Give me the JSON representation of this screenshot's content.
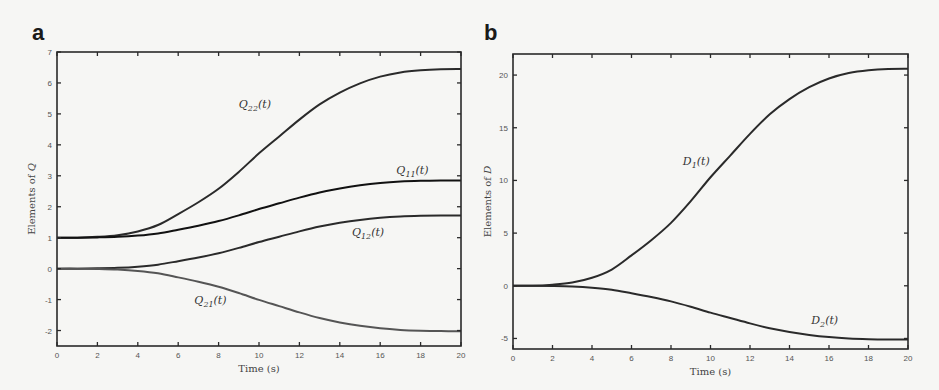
{
  "chart_data": [
    {
      "panel": "a",
      "type": "line",
      "xlabel": "Time (s)",
      "ylabel": "Elements of Q",
      "xlim": [
        0,
        20
      ],
      "ylim": [
        -2.5,
        7
      ],
      "xticks": [
        0,
        2,
        4,
        6,
        8,
        10,
        12,
        14,
        16,
        18,
        20
      ],
      "yticks": [
        -2,
        -1,
        0,
        1,
        2,
        3,
        4,
        5,
        6,
        7
      ],
      "grid": false,
      "legend": "inline curve labels",
      "x": [
        0,
        1,
        2,
        3,
        4,
        5,
        6,
        7,
        8,
        9,
        10,
        11,
        12,
        13,
        14,
        15,
        16,
        17,
        18,
        19,
        20
      ],
      "series": [
        {
          "name": "Q22(t)",
          "label_main": "Q",
          "label_sub": "22",
          "start": 1.0,
          "end": 6.45,
          "label_pos": [
            9.0,
            5.2
          ],
          "color": "#2a2a2a"
        },
        {
          "name": "Q11(t)",
          "label_main": "Q",
          "label_sub": "11",
          "start": 1.0,
          "end": 2.85,
          "label_pos": [
            16.8,
            3.05
          ],
          "color": "#111111"
        },
        {
          "name": "Q12(t)",
          "label_main": "Q",
          "label_sub": "12",
          "start": 0.0,
          "end": 1.72,
          "label_pos": [
            14.6,
            1.05
          ],
          "color": "#2a2a2a"
        },
        {
          "name": "Q21(t)",
          "label_main": "Q",
          "label_sub": "21",
          "start": 0.0,
          "end": -2.02,
          "label_pos": [
            6.8,
            -1.15
          ],
          "color": "#555555"
        }
      ]
    },
    {
      "panel": "b",
      "type": "line",
      "xlabel": "Time (s)",
      "ylabel": "Elements of D",
      "xlim": [
        0,
        20
      ],
      "ylim": [
        -6,
        22
      ],
      "xticks": [
        0,
        2,
        4,
        6,
        8,
        10,
        12,
        14,
        16,
        18,
        20
      ],
      "yticks": [
        -5,
        0,
        5,
        10,
        15,
        20
      ],
      "grid": false,
      "legend": "inline curve labels",
      "x": [
        0,
        1,
        2,
        3,
        4,
        5,
        6,
        7,
        8,
        9,
        10,
        11,
        12,
        13,
        14,
        15,
        16,
        17,
        18,
        19,
        20
      ],
      "series": [
        {
          "name": "D1(t)",
          "label_main": "D",
          "label_sub": "1",
          "start": 0.0,
          "end": 20.6,
          "label_pos": [
            8.6,
            11.5
          ],
          "color": "#2a2a2a"
        },
        {
          "name": "D2(t)",
          "label_main": "D",
          "label_sub": "2",
          "start": 0.0,
          "end": -5.1,
          "label_pos": [
            15.1,
            -3.6
          ],
          "color": "#2a2a2a"
        }
      ]
    }
  ],
  "shape_profile": [
    0,
    0,
    0.005,
    0.015,
    0.037,
    0.075,
    0.14,
    0.21,
    0.29,
    0.39,
    0.5,
    0.6,
    0.7,
    0.79,
    0.86,
    0.915,
    0.955,
    0.98,
    0.993,
    0.999,
    1
  ],
  "panels": {
    "a": {
      "letter": "a",
      "xlabel": "Time (s)",
      "ylabel": "Elements of Q"
    },
    "b": {
      "letter": "b",
      "xlabel": "Time (s)",
      "ylabel": "Elements of D"
    }
  }
}
